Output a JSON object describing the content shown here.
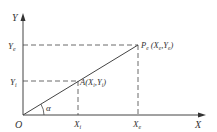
{
  "diagram": {
    "type": "linear-interpolation-coordinate-diagram",
    "colors": {
      "stroke": "#444444",
      "text": "#333333",
      "background": "#ffffff"
    },
    "axes": {
      "x_label": "X",
      "y_label": "Y",
      "origin_label": "O"
    },
    "ticks": {
      "x": [
        {
          "main": "X",
          "sub": "i"
        },
        {
          "main": "X",
          "sub": "e"
        }
      ],
      "y": [
        {
          "main": "Y",
          "sub": "e"
        },
        {
          "main": "Y",
          "sub": "i"
        }
      ]
    },
    "points": {
      "end": {
        "name": "P",
        "sub": "e",
        "coords": "(X",
        "c1sub": "e",
        "sep": ",Y",
        "c2sub": "e",
        "close": ")"
      },
      "intermediate": {
        "name": "A",
        "coords": "(X",
        "c1sub": "i",
        "sep": ",Y",
        "c2sub": "i",
        "close": ")"
      }
    },
    "angle_label": "α"
  }
}
